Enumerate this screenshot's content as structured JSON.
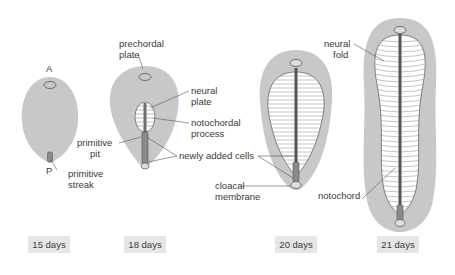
{
  "colors": {
    "disc_fill": "#c8c8c8",
    "plate_fill": "#ffffff",
    "notochord": "#6e6e6e",
    "outline": "#555555",
    "label_text": "#3a3a3a",
    "day_box": "#e6e6e6"
  },
  "stages": [
    {
      "day_label": "15 days",
      "labels": {
        "anterior": "A",
        "posterior": "P",
        "primitive_streak_1": "primitive",
        "primitive_streak_2": "streak"
      }
    },
    {
      "day_label": "18 days",
      "labels": {
        "prechordal_1": "prechordal",
        "prechordal_2": "plate",
        "neural_plate_1": "neural",
        "neural_plate_2": "plate",
        "notochordal_1": "notochordal",
        "notochordal_2": "process",
        "primitive_pit_1": "primitive",
        "primitive_pit_2": "pit",
        "newly_added": "newly added cells"
      }
    },
    {
      "day_label": "20 days",
      "labels": {
        "cloacal_1": "cloacal",
        "cloacal_2": "membrane"
      }
    },
    {
      "day_label": "21 days",
      "labels": {
        "neural_fold_1": "neural",
        "neural_fold_2": "fold",
        "notochord": "notochord"
      }
    }
  ]
}
